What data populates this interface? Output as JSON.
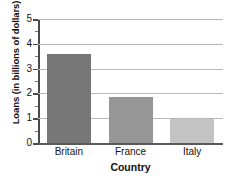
{
  "chart_data": {
    "type": "bar",
    "title": "",
    "categories": [
      "Britain",
      "France",
      "Italy"
    ],
    "values": [
      3.6,
      1.85,
      0.98
    ],
    "xlabel": "Country",
    "ylabel": "Loans (in billions of dollars)",
    "ylim": [
      0,
      5
    ],
    "yticks": [
      0,
      1,
      2,
      3,
      4,
      5
    ],
    "ytick_labels": [
      "0",
      "1",
      "2",
      "3",
      "4",
      "5"
    ],
    "minor_tick_interval": 0.5,
    "grid": "horizontal",
    "legend": "none",
    "bar_colors": [
      "#777777",
      "#969696",
      "#c4c4c4"
    ],
    "grid_color": "#b9b9b9",
    "axis_color": "#4a4a4a",
    "baseline_color": "#5a5a5a",
    "text_color": "#141414"
  }
}
